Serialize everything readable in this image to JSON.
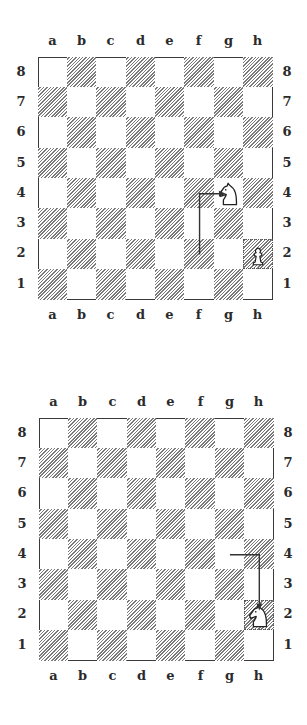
{
  "files": [
    "a",
    "b",
    "c",
    "d",
    "e",
    "f",
    "g",
    "h"
  ],
  "ranks": [
    "8",
    "7",
    "6",
    "5",
    "4",
    "3",
    "2",
    "1"
  ],
  "colors": {
    "dark_hatch": "#7a7a7a",
    "border": "#3a3a3a",
    "arrow": "#333333",
    "label": "#2a2a2a"
  },
  "diagrams": [
    {
      "pieces": [
        {
          "type": "knight",
          "color": "white",
          "square": "g4",
          "icon": "white-knight-icon"
        },
        {
          "type": "pawn",
          "color": "white",
          "square": "h2",
          "icon": "white-pawn-icon",
          "marked": true
        }
      ],
      "arrow": {
        "path": [
          "f2",
          "f4",
          "g4"
        ],
        "description": "f2 up to f4, then right to g4"
      }
    },
    {
      "pieces": [
        {
          "type": "knight",
          "color": "white",
          "square": "h2",
          "icon": "white-knight-icon",
          "marked": true
        }
      ],
      "arrow": {
        "path": [
          "g4",
          "h4",
          "h2"
        ],
        "description": "g4 right to h4, then down to h2"
      }
    }
  ]
}
